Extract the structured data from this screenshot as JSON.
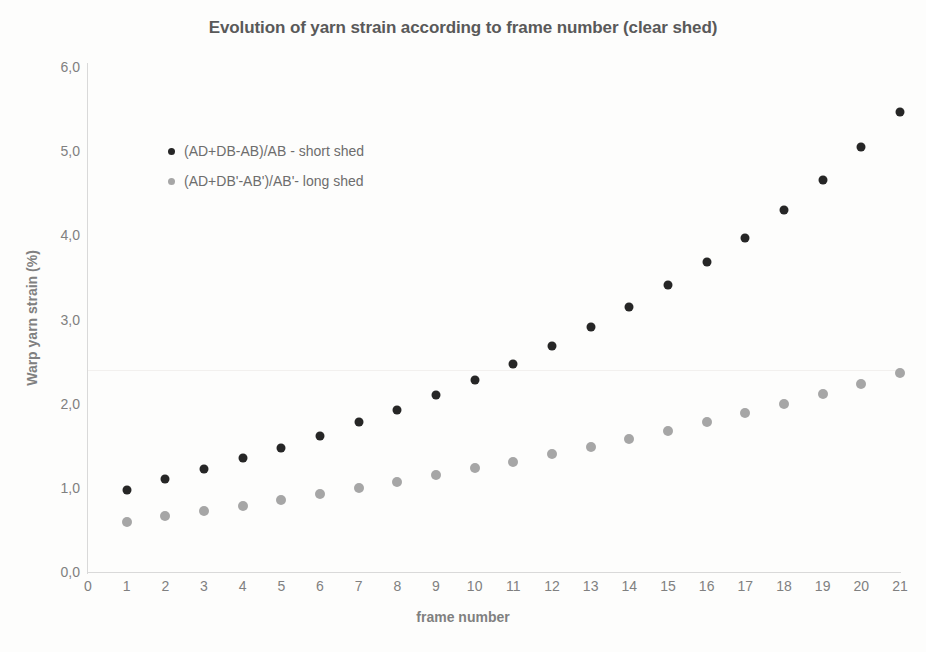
{
  "chart_data": {
    "type": "scatter",
    "title": "Evolution of yarn strain according to frame number (clear shed)",
    "xlabel": "frame number",
    "ylabel": "Warp yarn strain (%)",
    "xlim": [
      0,
      21
    ],
    "ylim": [
      0,
      6
    ],
    "grid": false,
    "legend_position": "inside-top-left",
    "x": [
      1,
      2,
      3,
      4,
      5,
      6,
      7,
      8,
      9,
      10,
      11,
      12,
      13,
      14,
      15,
      16,
      17,
      18,
      19,
      20,
      21
    ],
    "xticks": [
      "0",
      "1",
      "2",
      "3",
      "4",
      "5",
      "6",
      "7",
      "8",
      "9",
      "10",
      "11",
      "12",
      "13",
      "14",
      "15",
      "16",
      "17",
      "18",
      "19",
      "20",
      "21"
    ],
    "yticks": [
      "0,0",
      "1,0",
      "2,0",
      "3,0",
      "4,0",
      "5,0",
      "6,0"
    ],
    "ytick_values": [
      0,
      1,
      2,
      3,
      4,
      5,
      6
    ],
    "series": [
      {
        "name": "(AD+DB-AB)/AB - short shed",
        "color": "#262626",
        "marker": "circle",
        "values": [
          0.98,
          1.1,
          1.22,
          1.35,
          1.47,
          1.62,
          1.78,
          1.93,
          2.1,
          2.28,
          2.47,
          2.68,
          2.91,
          3.15,
          3.41,
          3.68,
          3.97,
          4.3,
          4.66,
          5.05,
          5.47
        ]
      },
      {
        "name": "(AD+DB'-AB')/AB'- long shed",
        "color": "#a6a6a6",
        "marker": "circle",
        "values": [
          0.6,
          0.66,
          0.72,
          0.79,
          0.86,
          0.93,
          1.0,
          1.07,
          1.15,
          1.23,
          1.31,
          1.4,
          1.49,
          1.58,
          1.68,
          1.78,
          1.89,
          2.0,
          2.11,
          2.23,
          2.36
        ]
      }
    ]
  },
  "colors": {
    "series_short_shed": "#262626",
    "series_long_shed": "#a6a6a6",
    "axis": "#d9d9d9",
    "tick_text": "#808080",
    "title_text": "#595959",
    "gridline": "#f2f0ee",
    "background": "#fdfdfc"
  }
}
